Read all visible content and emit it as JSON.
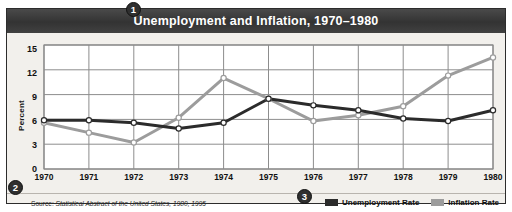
{
  "figure": {
    "title": "Unemployment and Inflation, 1970–1980",
    "source": "Source: Statistical Abstract of the United States, 1980, 1995",
    "source_lead": "Source:",
    "source_italic": "Statistical Abstract of the United States, 1980, 1995",
    "callouts": [
      {
        "id": "1",
        "label": "1",
        "target": "title"
      },
      {
        "id": "2",
        "label": "2",
        "target": "source"
      },
      {
        "id": "3",
        "label": "3",
        "target": "legend"
      }
    ],
    "colors": {
      "title_bar": "#3b3b3b",
      "title_text": "#ffffff",
      "panel_bg": "#f2f0ec",
      "plot_bg": "#ffffff",
      "border": "#2c2c2c",
      "grid": "#8d8d8d",
      "unemployment": "#2b2b2b",
      "inflation": "#9c9c9c",
      "marker_fill": "#ffffff"
    }
  },
  "chart_data": {
    "type": "line",
    "title": "Unemployment and Inflation, 1970–1980",
    "xlabel": "",
    "ylabel": "Percent",
    "categories": [
      "1970",
      "1971",
      "1972",
      "1973",
      "1974",
      "1975",
      "1976",
      "1977",
      "1978",
      "1979",
      "1980"
    ],
    "x": [
      1970,
      1971,
      1972,
      1973,
      1974,
      1975,
      1976,
      1977,
      1978,
      1979,
      1980
    ],
    "ylim": [
      0,
      15
    ],
    "yticks": [
      0,
      3,
      6,
      9,
      12,
      15
    ],
    "xlim": [
      1970,
      1980
    ],
    "grid": true,
    "legend_position": "bottom-right",
    "markers": "open-circle",
    "series": [
      {
        "name": "Unemployment Rate",
        "color": "#2b2b2b",
        "values": [
          5.9,
          5.9,
          5.6,
          4.9,
          5.6,
          8.5,
          7.7,
          7.1,
          6.1,
          5.8,
          7.1
        ]
      },
      {
        "name": "Inflation Rate",
        "color": "#9c9c9c",
        "values": [
          5.6,
          4.4,
          3.2,
          6.2,
          11.0,
          8.5,
          5.8,
          6.5,
          7.6,
          11.3,
          13.5
        ]
      }
    ]
  }
}
